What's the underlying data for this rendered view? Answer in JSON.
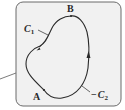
{
  "diagram": {
    "type": "closed-curve-path-diagram",
    "points": [
      {
        "label": "A",
        "x": 44,
        "y": 90
      },
      {
        "label": "B",
        "x": 71,
        "y": 16
      }
    ],
    "curves": [
      {
        "name": "C",
        "subscript": "1",
        "label": "C1",
        "direction": "A to B (left side, upward)"
      },
      {
        "name": "−C",
        "subscript": "2",
        "label": "−C2",
        "direction": "A to B (right side, upward)"
      }
    ],
    "labels": {
      "point_a": "A",
      "point_b": "B",
      "c1_main": "C",
      "c1_sub": "1",
      "c2_prefix": "−",
      "c2_main": "C",
      "c2_sub": "2"
    },
    "colors": {
      "panel_bg": "#f1f1f1",
      "panel_border": "#6b6b6b",
      "curve": "#2a2a2a",
      "leader_line": "#5a5a5a"
    }
  }
}
